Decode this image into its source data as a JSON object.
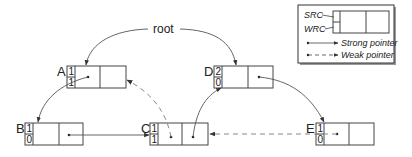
{
  "diagram": {
    "root_label": "root",
    "nodes": [
      {
        "id": "A",
        "label": "A",
        "src": "1",
        "wrc": "1"
      },
      {
        "id": "B",
        "label": "B",
        "src": "1",
        "wrc": "0"
      },
      {
        "id": "C",
        "label": "C",
        "src": "1",
        "wrc": "1"
      },
      {
        "id": "D",
        "label": "D",
        "src": "2",
        "wrc": "0"
      },
      {
        "id": "E",
        "label": "E",
        "src": "1",
        "wrc": "0"
      }
    ],
    "edges": [
      {
        "from": "root",
        "to": "A",
        "type": "strong"
      },
      {
        "from": "root",
        "to": "D",
        "type": "strong"
      },
      {
        "from": "A",
        "to": "B",
        "type": "strong"
      },
      {
        "from": "B",
        "to": "C",
        "type": "strong"
      },
      {
        "from": "C",
        "to": "A",
        "type": "weak"
      },
      {
        "from": "C",
        "to": "D",
        "type": "strong"
      },
      {
        "from": "D",
        "to": "E",
        "type": "strong"
      },
      {
        "from": "E",
        "to": "C",
        "type": "weak"
      }
    ]
  },
  "legend": {
    "src_label": "SRC",
    "wrc_label": "WRC",
    "strong_label": "Strong pointer",
    "weak_label": "Weak pointer"
  }
}
